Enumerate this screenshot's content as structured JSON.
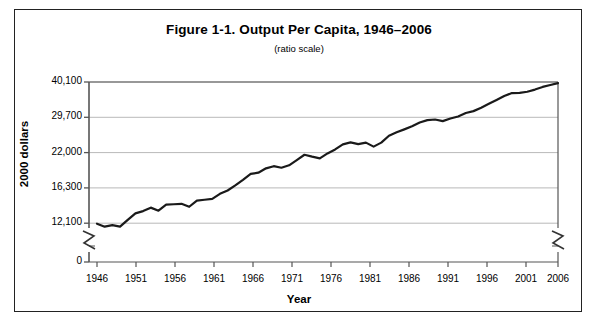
{
  "figure": {
    "title": "Figure 1-1. Output Per Capita, 1946–2006",
    "subtitle": "(ratio scale)",
    "x_axis_title": "Year",
    "y_axis_title": "2000 dollars"
  },
  "chart_data": {
    "type": "line",
    "title": "Figure 1-1. Output Per Capita, 1946–2006",
    "subtitle": "(ratio scale)",
    "xlabel": "Year",
    "ylabel": "2000 dollars",
    "scale": "ratio (logarithmic)",
    "grid": true,
    "legend": "none",
    "axis_break_y": true,
    "axis_break_right": true,
    "ylim": [
      0,
      40100
    ],
    "ytick_labels": [
      "40,100",
      "29,700",
      "22,000",
      "16,300",
      "12,100",
      "0"
    ],
    "ytick_values": [
      40100,
      29700,
      22000,
      16300,
      12100,
      0
    ],
    "xlim": [
      1946,
      2006
    ],
    "xtick_labels": [
      "1946",
      "1951",
      "1956",
      "1961",
      "1966",
      "1971",
      "1976",
      "1981",
      "1986",
      "1991",
      "1996",
      "2001",
      "2006"
    ],
    "xtick_values": [
      1946,
      1951,
      1956,
      1961,
      1966,
      1971,
      1976,
      1981,
      1986,
      1991,
      1996,
      2001,
      2006
    ],
    "series": [
      {
        "name": "Output per capita",
        "color": "#1a1a1a",
        "x": [
          1946,
          1947,
          1948,
          1949,
          1950,
          1951,
          1952,
          1953,
          1954,
          1955,
          1956,
          1957,
          1958,
          1959,
          1960,
          1961,
          1962,
          1963,
          1964,
          1965,
          1966,
          1967,
          1968,
          1969,
          1970,
          1971,
          1972,
          1973,
          1974,
          1975,
          1976,
          1977,
          1978,
          1979,
          1980,
          1981,
          1982,
          1983,
          1984,
          1985,
          1986,
          1987,
          1988,
          1989,
          1990,
          1991,
          1992,
          1993,
          1994,
          1995,
          1996,
          1997,
          1998,
          1999,
          2000,
          2001,
          2002,
          2003,
          2004,
          2005,
          2006
        ],
        "y": [
          12050,
          11750,
          11900,
          11750,
          12450,
          13150,
          13400,
          13800,
          13450,
          14150,
          14200,
          14250,
          13900,
          14650,
          14750,
          14850,
          15500,
          15950,
          16650,
          17450,
          18350,
          18550,
          19250,
          19600,
          19350,
          19750,
          20650,
          21600,
          21250,
          20950,
          21850,
          22600,
          23600,
          24000,
          23650,
          23950,
          23150,
          23950,
          25400,
          26150,
          26800,
          27500,
          28400,
          29000,
          29150,
          28750,
          29400,
          29900,
          30800,
          31300,
          32200,
          33300,
          34400,
          35600,
          36500,
          36550,
          36900,
          37600,
          38450,
          39100,
          39700
        ]
      }
    ]
  },
  "y_ticks": [
    {
      "label": "40,100",
      "y": 82
    },
    {
      "label": "29,700",
      "y": 117.3
    },
    {
      "label": "22,000",
      "y": 152.6
    },
    {
      "label": "16,300",
      "y": 187.9
    },
    {
      "label": "12,100",
      "y": 223.2
    },
    {
      "label": "0",
      "y": 262
    }
  ],
  "x_ticks": [
    {
      "label": "1946",
      "x": 97
    },
    {
      "label": "1951",
      "x": 136
    },
    {
      "label": "1956",
      "x": 175
    },
    {
      "label": "1961",
      "x": 214
    },
    {
      "label": "1966",
      "x": 253
    },
    {
      "label": "1971",
      "x": 292
    },
    {
      "label": "1976",
      "x": 331
    },
    {
      "label": "1981",
      "x": 370
    },
    {
      "label": "1986",
      "x": 409
    },
    {
      "label": "1991",
      "x": 448
    },
    {
      "label": "1996",
      "x": 487
    },
    {
      "label": "2001",
      "x": 526
    },
    {
      "label": "2006",
      "x": 558
    }
  ]
}
